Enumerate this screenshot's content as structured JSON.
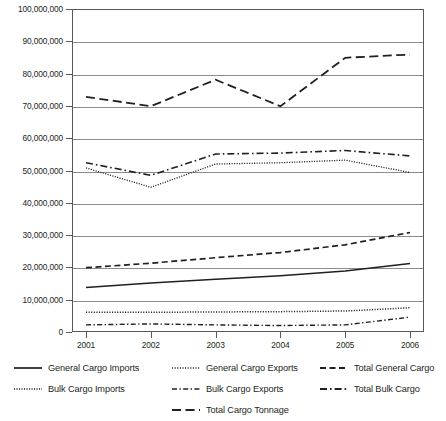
{
  "chart_data": {
    "type": "line",
    "title": "",
    "xlabel": "",
    "ylabel": "",
    "x": [
      2001,
      2002,
      2003,
      2004,
      2005,
      2006
    ],
    "categories": [
      "2001",
      "2002",
      "2003",
      "2004",
      "2005",
      "2006"
    ],
    "xlim": [
      2001,
      2006
    ],
    "ylim": [
      0,
      100000000
    ],
    "grid": true,
    "legend_position": "bottom",
    "y_ticks": [
      0,
      10000000,
      20000000,
      30000000,
      40000000,
      50000000,
      60000000,
      70000000,
      80000000,
      90000000,
      100000000
    ],
    "y_tick_labels": [
      "0",
      "10,000,000",
      "20,000,000",
      "30,000,000",
      "40,000,000",
      "50,000,000",
      "60,000,000",
      "70,000,000",
      "80,000,000",
      "90,000,000",
      "100,000,000"
    ],
    "series": [
      {
        "name": "General Cargo Imports",
        "style": "solid",
        "values": [
          13800000,
          15200000,
          16300000,
          17400000,
          18900000,
          21200000
        ]
      },
      {
        "name": "General Cargo Exports",
        "style": "dotted",
        "values": [
          6100000,
          6100000,
          6200000,
          6300000,
          6500000,
          7500000
        ]
      },
      {
        "name": "Total General Cargo",
        "style": "dashed",
        "values": [
          19900000,
          21300000,
          23000000,
          24600000,
          27000000,
          30800000
        ]
      },
      {
        "name": "Bulk Cargo Imports",
        "style": "fine-dotted",
        "values": [
          50800000,
          44800000,
          52000000,
          52400000,
          53200000,
          49400000
        ]
      },
      {
        "name": "Bulk Cargo Exports",
        "style": "dash-dot-short",
        "values": [
          2200000,
          2500000,
          2200000,
          2000000,
          2200000,
          4600000
        ]
      },
      {
        "name": "Total Bulk Cargo",
        "style": "dash-dot",
        "values": [
          52400000,
          48500000,
          55100000,
          55400000,
          56200000,
          54500000
        ]
      },
      {
        "name": "Total Cargo Tonnage",
        "style": "long-dash",
        "values": [
          72800000,
          69900000,
          78100000,
          69900000,
          84900000,
          85900000
        ]
      }
    ]
  },
  "legend": {
    "rows": [
      [
        {
          "label": "General Cargo Imports",
          "style": "solid"
        },
        {
          "label": "General Cargo Exports",
          "style": "dotted"
        },
        {
          "label": "Total General Cargo",
          "style": "dashed"
        }
      ],
      [
        {
          "label": "Bulk Cargo Imports",
          "style": "fine-dotted"
        },
        {
          "label": "Bulk Cargo Exports",
          "style": "dash-dot-short"
        },
        {
          "label": "Total Bulk Cargo",
          "style": "dash-dot"
        }
      ],
      [
        {
          "label": "Total Cargo Tonnage",
          "style": "long-dash"
        }
      ]
    ]
  },
  "colors": {
    "line": "#231f20",
    "grid": "#8c8c8e",
    "frame": "#58595b",
    "background": "#ffffff"
  }
}
